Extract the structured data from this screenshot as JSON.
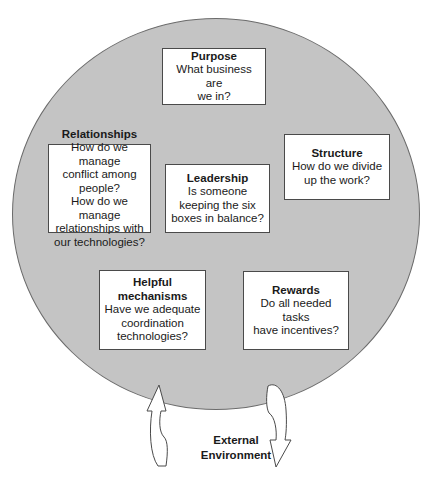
{
  "diagram": {
    "boxes": {
      "purpose": {
        "title": "Purpose",
        "question": "What business are\nwe in?"
      },
      "relationships": {
        "title": "Relationships",
        "question": "How do we manage\nconflict among\npeople?\nHow do we manage\nrelationships with\nour technologies?"
      },
      "leadership": {
        "title": "Leadership",
        "question": "Is someone\nkeeping the six\nboxes in balance?"
      },
      "structure": {
        "title": "Structure",
        "question": "How do we divide\nup the work?"
      },
      "helpful_mechanisms": {
        "title": "Helpful\nmechanisms",
        "question": "Have we adequate\ncoordination\ntechnologies?"
      },
      "rewards": {
        "title": "Rewards",
        "question": "Do all needed tasks\nhave incentives?"
      }
    },
    "environment_label": "External\nEnvironment",
    "arrows": [
      {
        "direction": "up",
        "meaning": "environment-to-organization"
      },
      {
        "direction": "down",
        "meaning": "organization-to-environment"
      }
    ],
    "colors": {
      "circle_fill": "#c4c4c4",
      "circle_stroke": "#6b6b6b",
      "box_fill": "#ffffff",
      "box_stroke": "#4a4a4a"
    }
  }
}
